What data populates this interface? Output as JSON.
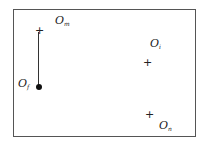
{
  "diagram": {
    "points": [
      {
        "id": "Om",
        "label": "O",
        "subscript": "m",
        "marker": "+"
      },
      {
        "id": "Of",
        "label": "O",
        "subscript": "f",
        "marker": "dot"
      },
      {
        "id": "Oi",
        "label": "O",
        "subscript": "i",
        "marker": "+"
      },
      {
        "id": "On",
        "label": "O",
        "subscript": "n",
        "marker": "+"
      }
    ],
    "plus": "+"
  }
}
